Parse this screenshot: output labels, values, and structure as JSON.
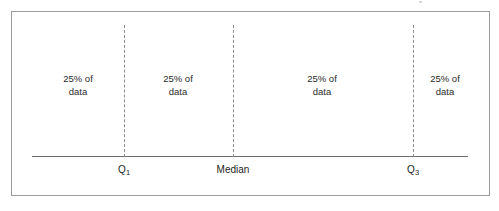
{
  "figure": {
    "type": "quartile-number-line-diagram",
    "width": 499,
    "height": 211,
    "background_color": "#ffffff",
    "frame_color": "#9a9a9a",
    "axis_color": "#6d6d6d",
    "divider_color": "#8d8d8d",
    "text_color": "#2a2a2a"
  },
  "chart_data": {
    "type": "bar",
    "title": "",
    "subtitle": "",
    "xlabel": "",
    "ylabel": "",
    "orientation": "horizontal",
    "grid": false,
    "legend": null,
    "axis": {
      "line_y_px": 156,
      "line_start_px": 32,
      "line_end_px": 468,
      "ticks": [
        {
          "label": "Q",
          "subscript": "1",
          "x_px": 124
        },
        {
          "label": "Median",
          "subscript": "",
          "x_px": 233
        },
        {
          "label": "Q",
          "subscript": "3",
          "x_px": 413
        }
      ]
    },
    "dividers": [
      {
        "name": "first-quartile-divider",
        "x_px": 124,
        "style": "dashed"
      },
      {
        "name": "median-divider",
        "x_px": 233,
        "style": "dashed"
      },
      {
        "name": "third-quartile-divider",
        "x_px": 413,
        "style": "dashed"
      }
    ],
    "categories": [
      "Below Q1",
      "Q1 to Median",
      "Median to Q3",
      "Above Q3"
    ],
    "values": [
      25,
      25,
      25,
      25
    ],
    "value_unit": "percent",
    "regions": [
      {
        "name": "region-below-q1",
        "line1": "25% of",
        "line2": "data",
        "percent": 25,
        "center_x_px": 78
      },
      {
        "name": "region-q1-to-median",
        "line1": "25% of",
        "line2": "data",
        "percent": 25,
        "center_x_px": 178
      },
      {
        "name": "region-median-to-q3",
        "line1": "25% of",
        "line2": "data",
        "percent": 25,
        "center_x_px": 322
      },
      {
        "name": "region-above-q3",
        "line1": "25% of",
        "line2": "data",
        "percent": 25,
        "center_x_px": 445
      }
    ],
    "annotations": [
      "25% of data",
      "25% of data",
      "25% of data",
      "25% of data",
      "Q1",
      "Median",
      "Q3"
    ]
  }
}
